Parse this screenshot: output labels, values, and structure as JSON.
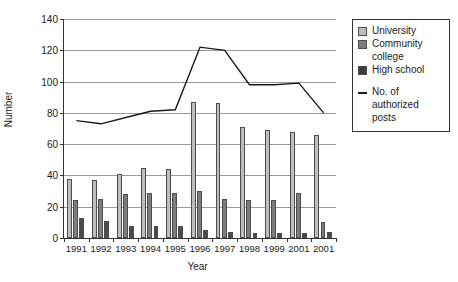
{
  "chart_data": {
    "type": "bar",
    "title": "",
    "xlabel": "Year",
    "ylabel": "Number",
    "ylim": [
      0,
      140
    ],
    "ytick_step": 20,
    "yticks": [
      0,
      20,
      40,
      60,
      80,
      100,
      120,
      140
    ],
    "grid": true,
    "legend_position": "right",
    "categories": [
      "1991",
      "1992",
      "1993",
      "1994",
      "1995",
      "1996",
      "1997",
      "1998",
      "1999",
      "2001",
      "2001"
    ],
    "series": [
      {
        "name": "University",
        "type": "bar",
        "color": "#bdbdbd",
        "values": [
          38,
          37,
          41,
          45,
          44,
          87,
          86,
          71,
          69,
          68,
          66
        ]
      },
      {
        "name": "Community college",
        "type": "bar",
        "color": "#7d7d7d",
        "values": [
          24,
          25,
          28,
          29,
          29,
          30,
          25,
          24,
          24,
          29,
          10
        ]
      },
      {
        "name": "High school",
        "type": "bar",
        "color": "#4a4a4a",
        "values": [
          13,
          11,
          8,
          8,
          8,
          5,
          4,
          3,
          3,
          3,
          4
        ]
      },
      {
        "name": "No. of authorized posts",
        "type": "line",
        "color": "#1a1a1a",
        "values": [
          75,
          73,
          77,
          81,
          82,
          122,
          120,
          98,
          98,
          99,
          80
        ]
      }
    ]
  },
  "legend": {
    "entries": [
      {
        "label": "University",
        "marker": "swatch-light"
      },
      {
        "label": "Community",
        "marker": "swatch-medium"
      },
      {
        "label": "college",
        "marker": "continuation"
      },
      {
        "label": "High school",
        "marker": "swatch-dark"
      },
      {
        "label": "No. of",
        "marker": "line"
      },
      {
        "label": "authorized",
        "marker": "continuation"
      },
      {
        "label": "posts",
        "marker": "continuation"
      }
    ]
  }
}
